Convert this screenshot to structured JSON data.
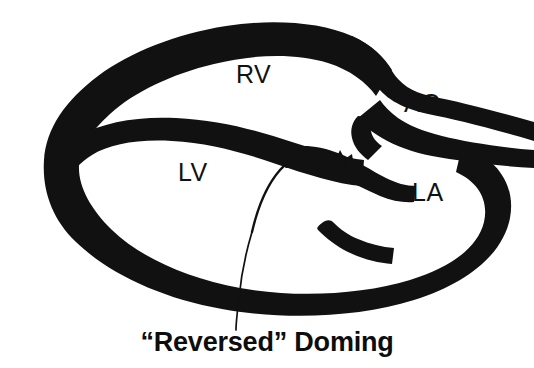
{
  "figure": {
    "background_color": "#ffffff",
    "ink_color": "#111111",
    "caption": "“Reversed” Doming"
  },
  "labels": {
    "rv": "RV",
    "ao": "AO",
    "lv": "LV",
    "la": "LA"
  },
  "label_meanings": {
    "rv": "right ventricle",
    "ao": "aorta",
    "lv": "left ventricle",
    "la": "left atrium"
  },
  "annotations": {
    "arrow": {
      "name": "curved-arrow",
      "description": "curved arrow sweeping from the left ventricular cavity up and over, pointing down onto the anterior mitral leaflet",
      "direction": "down-right"
    },
    "leader_line": {
      "name": "caption-leader-line",
      "description": "thin line running from the caption up through the inferior wall into the left ventricle"
    }
  }
}
